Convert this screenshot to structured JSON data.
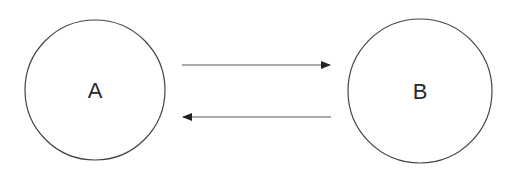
{
  "diagram": {
    "nodes": [
      {
        "id": "A",
        "label": "A",
        "cx": 95,
        "cy": 90,
        "r": 70
      },
      {
        "id": "B",
        "label": "B",
        "cx": 420,
        "cy": 91,
        "r": 72
      }
    ],
    "edges": [
      {
        "from": "A",
        "to": "B",
        "direction": "right"
      },
      {
        "from": "B",
        "to": "A",
        "direction": "left"
      }
    ],
    "colors": {
      "stroke": "#444444",
      "text": "#2a2a2a",
      "background": "#ffffff"
    }
  }
}
